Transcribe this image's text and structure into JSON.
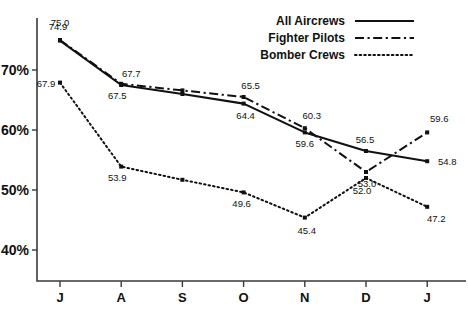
{
  "chart_data": {
    "type": "line",
    "title": "",
    "xlabel": "",
    "ylabel": "",
    "categories": [
      "J",
      "A",
      "S",
      "O",
      "N",
      "D",
      "J"
    ],
    "ylim": [
      38,
      78
    ],
    "yticks": [
      40,
      50,
      60,
      70
    ],
    "ytick_labels": [
      "40%",
      "50%",
      "60%",
      "70%"
    ],
    "grid": false,
    "legend_position": "top-right",
    "series": [
      {
        "name": "All Aircrews",
        "style": "solid",
        "values": [
          74.9,
          67.5,
          66.0,
          64.4,
          59.6,
          56.5,
          54.8
        ],
        "labels": [
          "74.9",
          "67.5",
          "",
          "64.4",
          "59.6",
          "56.5",
          "54.8"
        ]
      },
      {
        "name": "Fighter Pilots",
        "style": "dash-dot",
        "values": [
          75.0,
          67.7,
          66.6,
          65.5,
          60.3,
          53.0,
          59.6
        ],
        "labels": [
          "75.0",
          "67.7",
          "",
          "65.5",
          "60.3",
          "53.0",
          "59.6"
        ]
      },
      {
        "name": "Bomber Crews",
        "style": "dotted",
        "values": [
          67.9,
          53.9,
          51.7,
          49.6,
          45.4,
          52.0,
          47.2
        ],
        "labels": [
          "67.9",
          "53.9",
          "",
          "49.6",
          "45.4",
          "52.0",
          "47.2"
        ]
      }
    ]
  },
  "legend": {
    "items": [
      {
        "label": "All Aircrews",
        "style": "solid"
      },
      {
        "label": "Fighter Pilots",
        "style": "dash-dot"
      },
      {
        "label": "Bomber Crews",
        "style": "dotted"
      }
    ]
  },
  "axes": {
    "y_tick_labels": [
      "70%",
      "60%",
      "50%",
      "40%"
    ],
    "x_tick_labels": [
      "J",
      "A",
      "S",
      "O",
      "N",
      "D",
      "J"
    ]
  }
}
